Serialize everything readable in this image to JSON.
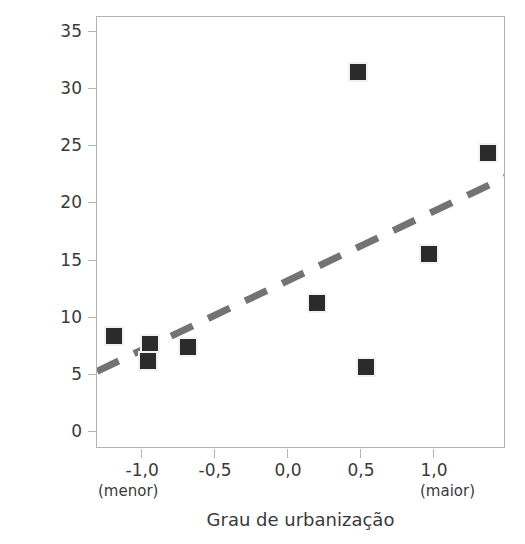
{
  "chart_data": {
    "type": "scatter",
    "title": "",
    "xlabel": "Grau de urbanização",
    "ylabel": "Percentual de aves com anticorpos",
    "xlim": [
      -1.316,
      1.486
    ],
    "ylim": [
      -1.4,
      36.4
    ],
    "grid": false,
    "legend": null,
    "decimal_separator": ",",
    "xticks": [
      -1.0,
      -0.5,
      0.0,
      0.5,
      1.0
    ],
    "xtick_labels": [
      "-1,0",
      "-0,5",
      "0,0",
      "0,5",
      "1,0"
    ],
    "yticks": [
      0,
      5,
      10,
      15,
      20,
      25,
      30,
      35
    ],
    "ytick_labels": [
      "0",
      "5",
      "10",
      "15",
      "20",
      "25",
      "30",
      "35"
    ],
    "x_axis_endnotes": {
      "left": "(menor)",
      "right": "(maior)"
    },
    "points": [
      {
        "x": -1.2,
        "y": 8.5
      },
      {
        "x": -0.95,
        "y": 7.8
      },
      {
        "x": -0.97,
        "y": 6.3
      },
      {
        "x": -0.69,
        "y": 7.5
      },
      {
        "x": 0.19,
        "y": 11.4
      },
      {
        "x": 0.47,
        "y": 31.6
      },
      {
        "x": 0.53,
        "y": 5.8
      },
      {
        "x": 0.96,
        "y": 15.7
      },
      {
        "x": 1.36,
        "y": 24.5
      }
    ],
    "trend_line": {
      "style": "dashed",
      "x0": -1.316,
      "y0": 5.4,
      "x1": 1.486,
      "y1": 22.4,
      "color": "#737373"
    },
    "marker": {
      "shape": "square",
      "color": "#2b2b2b",
      "halo_color": "#f2f2f2",
      "size_px": 20
    },
    "frame_color": "#b4b4b4",
    "text_color": "#3a3a3a"
  }
}
